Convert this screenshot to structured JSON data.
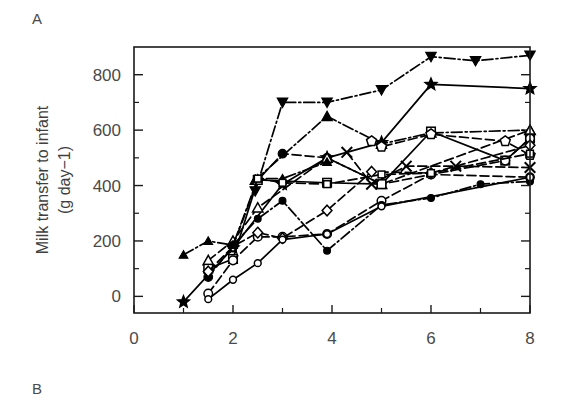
{
  "figure": {
    "panel_a_label": "A",
    "panel_b_label": "B",
    "background": "#ffffff",
    "ink": "#000000"
  },
  "chart_data": {
    "type": "line",
    "title": "",
    "subtitle": "",
    "xlabel": "",
    "ylabel": "Milk transfer to infant (g day−1)",
    "ylabel_line1": "Milk transfer to infant",
    "ylabel_line2": "(g day−1)",
    "xlim": [
      0,
      8
    ],
    "ylim": [
      -60,
      900
    ],
    "xticks": [
      0,
      2,
      4,
      6,
      8
    ],
    "xtick_labels": [
      "0",
      "2",
      "4",
      "6",
      "8"
    ],
    "yticks": [
      0,
      200,
      400,
      600,
      800
    ],
    "ytick_labels": [
      "0",
      "200",
      "400",
      "600",
      "800"
    ],
    "xminor_ticks": [
      1,
      3,
      5,
      7
    ],
    "yminor_ticks": [
      100,
      300,
      500,
      700
    ],
    "grid": false,
    "legend": "none",
    "legend_position": "none",
    "annotations": [],
    "series": [
      {
        "name": "infant-1",
        "marker": "triangle-down-filled",
        "linestyle": "dashdot",
        "x": [
          2.45,
          3.0,
          3.9,
          5.0,
          6.0,
          6.9,
          8.0
        ],
        "y": [
          380,
          700,
          700,
          745,
          865,
          850,
          870
        ]
      },
      {
        "name": "infant-2",
        "marker": "triangle-up-filled",
        "linestyle": "dashdot",
        "x": [
          2.45,
          3.9,
          5.0,
          6.0,
          8.0
        ],
        "y": [
          420,
          650,
          550,
          590,
          600
        ]
      },
      {
        "name": "infant-3",
        "marker": "star-filled",
        "linestyle": "solid",
        "x": [
          1.0,
          2.0,
          3.0,
          3.9,
          5.0,
          6.0,
          8.0
        ],
        "y": [
          -20,
          175,
          405,
          500,
          555,
          765,
          750
        ]
      },
      {
        "name": "infant-4",
        "marker": "circle-filled",
        "linestyle": "dashed",
        "x": [
          1.5,
          2.0,
          2.5,
          3.0,
          3.9,
          5.0,
          6.0,
          8.0
        ],
        "y": [
          70,
          180,
          420,
          515,
          500,
          405,
          440,
          430
        ]
      },
      {
        "name": "infant-5",
        "marker": "triangle-up-open",
        "linestyle": "dashed",
        "x": [
          1.5,
          2.0,
          2.5,
          3.9,
          5.0,
          8.0
        ],
        "y": [
          130,
          200,
          320,
          500,
          405,
          600
        ]
      },
      {
        "name": "infant-6",
        "marker": "square-open",
        "linestyle": "solid",
        "x": [
          1.5,
          2.0,
          2.5,
          3.9,
          5.0,
          6.0,
          7.5,
          8.0
        ],
        "y": [
          100,
          135,
          420,
          410,
          405,
          595,
          490,
          570
        ]
      },
      {
        "name": "infant-7",
        "marker": "circle-open",
        "linestyle": "dashed",
        "x": [
          1.5,
          2.0,
          2.5,
          3.0,
          3.9,
          5.0,
          6.0,
          7.5,
          8.0
        ],
        "y": [
          10,
          130,
          215,
          215,
          225,
          345,
          440,
          490,
          570
        ]
      },
      {
        "name": "infant-8",
        "marker": "diamond-open",
        "linestyle": "dashed",
        "x": [
          1.5,
          2.0,
          2.5,
          3.0,
          3.9,
          4.8,
          6.0,
          8.0
        ],
        "y": [
          90,
          180,
          230,
          210,
          310,
          450,
          445,
          545
        ]
      },
      {
        "name": "infant-9",
        "marker": "circle-filled-small",
        "linestyle": "dashdot",
        "x": [
          2.0,
          2.5,
          3.0,
          3.9,
          5.0,
          6.0,
          7.0,
          8.0
        ],
        "y": [
          185,
          280,
          345,
          165,
          330,
          355,
          405,
          415
        ]
      },
      {
        "name": "infant-10",
        "marker": "triangle-up-filled-small",
        "linestyle": "dashdot",
        "x": [
          1.0,
          1.5,
          2.0,
          2.5,
          3.0,
          3.9
        ],
        "y": [
          150,
          200,
          185,
          425,
          425,
          485
        ]
      },
      {
        "name": "infant-11",
        "marker": "pentagon-open",
        "linestyle": "dashed",
        "x": [
          4.8,
          5.0,
          6.0,
          7.5,
          8.0
        ],
        "y": [
          560,
          540,
          585,
          560,
          510
        ]
      },
      {
        "name": "infant-12",
        "marker": "x-cross",
        "linestyle": "dashed",
        "x": [
          4.3,
          4.8,
          5.5,
          6.5,
          8.0
        ],
        "y": [
          520,
          405,
          470,
          470,
          465
        ]
      },
      {
        "name": "infant-13",
        "marker": "square-open-small",
        "linestyle": "dashed",
        "x": [
          2.5,
          3.0,
          3.9,
          5.0,
          6.0,
          8.0
        ],
        "y": [
          425,
          410,
          405,
          440,
          445,
          515
        ]
      },
      {
        "name": "infant-14",
        "marker": "circle-open-small",
        "linestyle": "solid",
        "x": [
          1.5,
          2.0,
          2.5,
          3.0,
          3.9,
          5.0,
          8.0
        ],
        "y": [
          -10,
          60,
          120,
          205,
          225,
          325,
          430
        ]
      }
    ]
  }
}
